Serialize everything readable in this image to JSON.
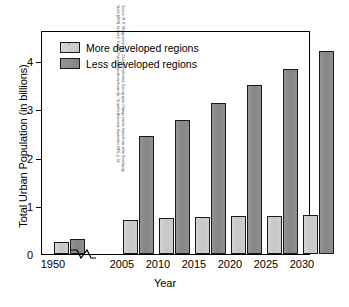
{
  "chart_data": {
    "type": "bar",
    "title": "",
    "xlabel": "Year",
    "ylabel": "Total Urban Population (in billions)",
    "categories": [
      "1950",
      "2005",
      "2010",
      "2015",
      "2020",
      "2025",
      "2030"
    ],
    "series": [
      {
        "name": "More developed regions",
        "color": "#c8c8c8",
        "values": [
          0.25,
          0.7,
          0.73,
          0.76,
          0.78,
          0.79,
          0.81
        ]
      },
      {
        "name": "Less developed regions",
        "color": "#8a8a8a",
        "values": [
          0.31,
          2.42,
          2.76,
          3.11,
          3.47,
          3.79,
          4.17
        ]
      }
    ],
    "ylim": [
      0,
      4.6
    ],
    "yticks": [
      0,
      1,
      2,
      3,
      4
    ],
    "ytick_labels": [
      "0",
      "1",
      "2",
      "3",
      "4"
    ],
    "grid": false,
    "legend_position": "top-left",
    "axis_break": {
      "present": true,
      "between": [
        "1950",
        "2005"
      ],
      "axis": "x"
    }
  },
  "legend": {
    "items": [
      {
        "label": "More developed regions",
        "swatch": "more"
      },
      {
        "label": "Less developed regions",
        "swatch": "less"
      }
    ]
  },
  "axes": {
    "y_title": "Total Urban Population (in billions)",
    "x_title": "Year",
    "y_ticks": [
      "4",
      "3",
      "2",
      "1",
      "0"
    ],
    "x_ticks": [
      "1950",
      "2005",
      "2010",
      "2015",
      "2020",
      "2025",
      "2030"
    ]
  },
  "source": {
    "line1": "Source: M. R. Montgomery et al., Cities Transformed: Demographic Change and Its Implications in the Developing",
    "line2": "World (2003). In Joel E. Cohen, \"Human Population Grows Up,\" Scientific American, September 2005, p. 52."
  }
}
